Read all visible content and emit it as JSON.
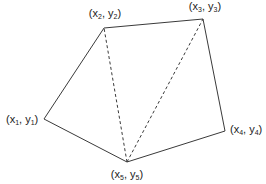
{
  "diagram": {
    "type": "polygon-triangulation",
    "vertices": [
      {
        "id": "p1",
        "var_x": "x",
        "var_y": "y",
        "index": "1",
        "label": "(x1, y1)"
      },
      {
        "id": "p2",
        "var_x": "x",
        "var_y": "y",
        "index": "2",
        "label": "(x2, y2)"
      },
      {
        "id": "p3",
        "var_x": "x",
        "var_y": "y",
        "index": "3",
        "label": "(x3, y3)"
      },
      {
        "id": "p4",
        "var_x": "x",
        "var_y": "y",
        "index": "4",
        "label": "(x4, y4)"
      },
      {
        "id": "p5",
        "var_x": "x",
        "var_y": "y",
        "index": "5",
        "label": "(x5, y5)"
      }
    ],
    "edges": [
      {
        "from": "p1",
        "to": "p2",
        "style": "solid"
      },
      {
        "from": "p2",
        "to": "p3",
        "style": "solid"
      },
      {
        "from": "p3",
        "to": "p4",
        "style": "solid"
      },
      {
        "from": "p4",
        "to": "p5",
        "style": "solid"
      },
      {
        "from": "p5",
        "to": "p1",
        "style": "solid"
      }
    ],
    "diagonals": [
      {
        "from": "p5",
        "to": "p2",
        "style": "dashed"
      },
      {
        "from": "p5",
        "to": "p3",
        "style": "dashed"
      }
    ],
    "colors": {
      "line": "#3a3a3a",
      "text": "#222222",
      "background": "#ffffff"
    }
  }
}
